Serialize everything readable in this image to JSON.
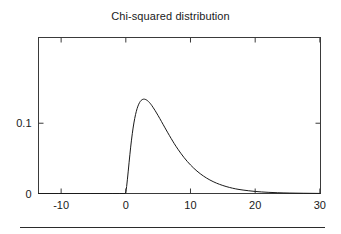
{
  "figure": {
    "title": "Chi-squared distribution",
    "background_color": "#ffffff",
    "line_color": "#1a1a1a",
    "axis_color": "#3a3a3a"
  },
  "axes": {
    "x_tick_labels": [
      "-10",
      "0",
      "10",
      "20",
      "30"
    ],
    "y_tick_labels": [
      "0",
      "0.1"
    ]
  },
  "footer": {
    "rule": ""
  },
  "chart_data": {
    "type": "line",
    "title": "Chi-squared distribution",
    "xlabel": "",
    "ylabel": "",
    "xlim": [
      -13.5,
      30.1
    ],
    "ylim": [
      0,
      0.222
    ],
    "xticks": [
      -10,
      0,
      10,
      20,
      30
    ],
    "yticks": [
      0,
      0.1
    ],
    "grid": false,
    "legend": null,
    "frame": "full-box-with-inward-ticks",
    "series": [
      {
        "name": "chi-squared pdf (df = 5)",
        "x": [
          -13.5,
          -0.2,
          0.0,
          0.25,
          0.5,
          0.75,
          1.0,
          1.25,
          1.5,
          1.75,
          2.0,
          2.25,
          2.5,
          2.75,
          3.0,
          3.25,
          3.5,
          3.75,
          4.0,
          4.5,
          5.0,
          5.5,
          6.0,
          6.5,
          7.0,
          7.5,
          8.0,
          9.0,
          10.0,
          11.0,
          12.0,
          13.0,
          14.0,
          15.0,
          16.0,
          17.0,
          18.0,
          20.0,
          22.0,
          25.0,
          30.0
        ],
        "y": [
          0.0,
          0.0,
          0.0,
          0.0198,
          0.0439,
          0.0664,
          0.0855,
          0.1008,
          0.1126,
          0.1213,
          0.1274,
          0.1314,
          0.1336,
          0.1344,
          0.1341,
          0.1329,
          0.131,
          0.1285,
          0.1255,
          0.1185,
          0.1108,
          0.1027,
          0.0944,
          0.0863,
          0.0784,
          0.0708,
          0.0637,
          0.0509,
          0.0404,
          0.0317,
          0.0247,
          0.0191,
          0.0147,
          0.0113,
          0.0086,
          0.0065,
          0.005,
          0.0028,
          0.0016,
          0.0006,
          0.0001
        ]
      }
    ]
  }
}
